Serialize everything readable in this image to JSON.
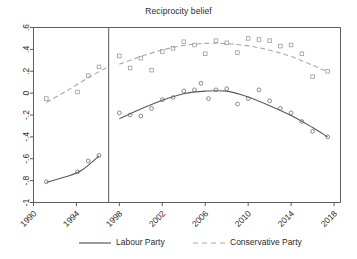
{
  "chart_data": {
    "type": "scatter",
    "title": "Reciprocity belief",
    "xlabel": "",
    "ylabel": "",
    "xlim": [
      1990,
      2018.6
    ],
    "ylim": [
      -1.0,
      0.6
    ],
    "grid": false,
    "legend_position": "bottom",
    "xticks": [
      "1990",
      "1994",
      "1998",
      "2002",
      "2006",
      "2010",
      "2014",
      "2018"
    ],
    "xtick_values": [
      1990,
      1994,
      1998,
      2002,
      2006,
      2010,
      2014,
      2018
    ],
    "ytick_labels": [
      ".6",
      ".4",
      ".2",
      "0",
      "-.2",
      "-.4",
      "-.6",
      "-.8",
      "-1"
    ],
    "ytick_values": [
      0.6,
      0.4,
      0.2,
      0,
      -0.2,
      -0.4,
      -0.6,
      -0.8,
      -1
    ],
    "annotations": [
      {
        "type": "vertical-line",
        "x": 1997.0,
        "label": "1997 election break"
      }
    ],
    "series": [
      {
        "name": "Labour Party",
        "marker": "circle",
        "linestyle": "solid",
        "color": "#59595b",
        "points_pre": [
          {
            "x": 1991.2,
            "y": -0.81
          },
          {
            "x": 1994.1,
            "y": -0.72
          },
          {
            "x": 1995.1,
            "y": -0.62
          },
          {
            "x": 1996.1,
            "y": -0.57
          }
        ],
        "points_post": [
          {
            "x": 1998.0,
            "y": -0.18
          },
          {
            "x": 1999.0,
            "y": -0.2
          },
          {
            "x": 2000.0,
            "y": -0.21
          },
          {
            "x": 2001.0,
            "y": -0.14
          },
          {
            "x": 2002.0,
            "y": -0.06
          },
          {
            "x": 2003.0,
            "y": -0.04
          },
          {
            "x": 2004.0,
            "y": 0.02
          },
          {
            "x": 2005.0,
            "y": 0.03
          },
          {
            "x": 2005.6,
            "y": 0.09
          },
          {
            "x": 2006.3,
            "y": -0.05
          },
          {
            "x": 2007.0,
            "y": 0.03
          },
          {
            "x": 2008.0,
            "y": 0.04
          },
          {
            "x": 2009.0,
            "y": -0.1
          },
          {
            "x": 2010.0,
            "y": -0.05
          },
          {
            "x": 2011.0,
            "y": 0.03
          },
          {
            "x": 2012.0,
            "y": -0.07
          },
          {
            "x": 2013.0,
            "y": -0.14
          },
          {
            "x": 2014.0,
            "y": -0.18
          },
          {
            "x": 2015.0,
            "y": -0.26
          },
          {
            "x": 2016.0,
            "y": -0.35
          },
          {
            "x": 2017.4,
            "y": -0.4
          }
        ],
        "fit_pre": [
          {
            "x": 1991.2,
            "y": -0.815
          },
          {
            "x": 1993.0,
            "y": -0.765
          },
          {
            "x": 1994.5,
            "y": -0.705
          },
          {
            "x": 1996.1,
            "y": -0.575
          }
        ],
        "fit_post": [
          {
            "x": 1998.0,
            "y": -0.235
          },
          {
            "x": 2000.0,
            "y": -0.145
          },
          {
            "x": 2002.0,
            "y": -0.065
          },
          {
            "x": 2004.0,
            "y": -0.005
          },
          {
            "x": 2006.0,
            "y": 0.018
          },
          {
            "x": 2008.0,
            "y": 0.018
          },
          {
            "x": 2010.0,
            "y": -0.035
          },
          {
            "x": 2012.0,
            "y": -0.115
          },
          {
            "x": 2014.0,
            "y": -0.205
          },
          {
            "x": 2016.0,
            "y": -0.315
          },
          {
            "x": 2017.4,
            "y": -0.4
          }
        ]
      },
      {
        "name": "Conservative Party",
        "marker": "square",
        "linestyle": "dashed",
        "color": "#a9a9ab",
        "points_pre": [
          {
            "x": 1991.2,
            "y": -0.05
          },
          {
            "x": 1994.1,
            "y": 0.01
          },
          {
            "x": 1995.1,
            "y": 0.16
          },
          {
            "x": 1996.1,
            "y": 0.24
          }
        ],
        "points_post": [
          {
            "x": 1998.0,
            "y": 0.34
          },
          {
            "x": 1999.0,
            "y": 0.23
          },
          {
            "x": 2000.0,
            "y": 0.32
          },
          {
            "x": 2001.0,
            "y": 0.21
          },
          {
            "x": 2002.0,
            "y": 0.38
          },
          {
            "x": 2003.0,
            "y": 0.41
          },
          {
            "x": 2004.0,
            "y": 0.47
          },
          {
            "x": 2005.0,
            "y": 0.44
          },
          {
            "x": 2006.0,
            "y": 0.36
          },
          {
            "x": 2007.0,
            "y": 0.48
          },
          {
            "x": 2008.0,
            "y": 0.46
          },
          {
            "x": 2009.0,
            "y": 0.37
          },
          {
            "x": 2010.0,
            "y": 0.5
          },
          {
            "x": 2011.0,
            "y": 0.49
          },
          {
            "x": 2012.0,
            "y": 0.48
          },
          {
            "x": 2013.0,
            "y": 0.43
          },
          {
            "x": 2014.0,
            "y": 0.44
          },
          {
            "x": 2015.0,
            "y": 0.36
          },
          {
            "x": 2016.0,
            "y": 0.15
          },
          {
            "x": 2017.4,
            "y": 0.2
          }
        ],
        "fit_pre": [
          {
            "x": 1991.2,
            "y": -0.085
          },
          {
            "x": 1993.0,
            "y": 0.015
          },
          {
            "x": 1995.0,
            "y": 0.135
          },
          {
            "x": 1997.0,
            "y": 0.245
          }
        ],
        "fit_post": [
          {
            "x": 1998.0,
            "y": 0.265
          },
          {
            "x": 2000.0,
            "y": 0.335
          },
          {
            "x": 2002.0,
            "y": 0.395
          },
          {
            "x": 2004.0,
            "y": 0.435
          },
          {
            "x": 2006.0,
            "y": 0.455
          },
          {
            "x": 2008.0,
            "y": 0.452
          },
          {
            "x": 2010.0,
            "y": 0.432
          },
          {
            "x": 2012.0,
            "y": 0.392
          },
          {
            "x": 2014.0,
            "y": 0.335
          },
          {
            "x": 2016.0,
            "y": 0.255
          },
          {
            "x": 2017.4,
            "y": 0.195
          }
        ]
      }
    ],
    "legend": [
      {
        "label": "Labour Party",
        "linestyle": "solid",
        "color": "#59595b"
      },
      {
        "label": "Conservative Party",
        "linestyle": "dashed",
        "color": "#a9a9ab"
      }
    ]
  }
}
